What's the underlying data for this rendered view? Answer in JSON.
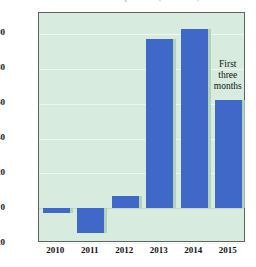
{
  "chart_data": {
    "type": "bar",
    "title": "Profit or loss from operations (in millions)",
    "xlabel": "",
    "ylabel": "",
    "categories": [
      "2010",
      "2011",
      "2012",
      "2013",
      "2014",
      "2015"
    ],
    "values": [
      -3,
      -14,
      7,
      97,
      103,
      62
    ],
    "ylim": [
      -20,
      112
    ],
    "yticks": [
      -20,
      0,
      20,
      40,
      60,
      80,
      100
    ],
    "ytick_labels": [
      "-20",
      "0",
      "20",
      "40",
      "60",
      "80",
      "$100"
    ],
    "grid": true,
    "legend": false,
    "annotations": [
      {
        "target_category": "2015",
        "lines": [
          "First",
          "three",
          "months"
        ]
      }
    ],
    "colors": {
      "bar": "#4068c8",
      "bar_edge_highlight": "#a9cfb4",
      "plot_background": "#d8ebdf",
      "gridline": "#eef6f1",
      "frame": "#5d6360",
      "text": "#111111"
    }
  }
}
